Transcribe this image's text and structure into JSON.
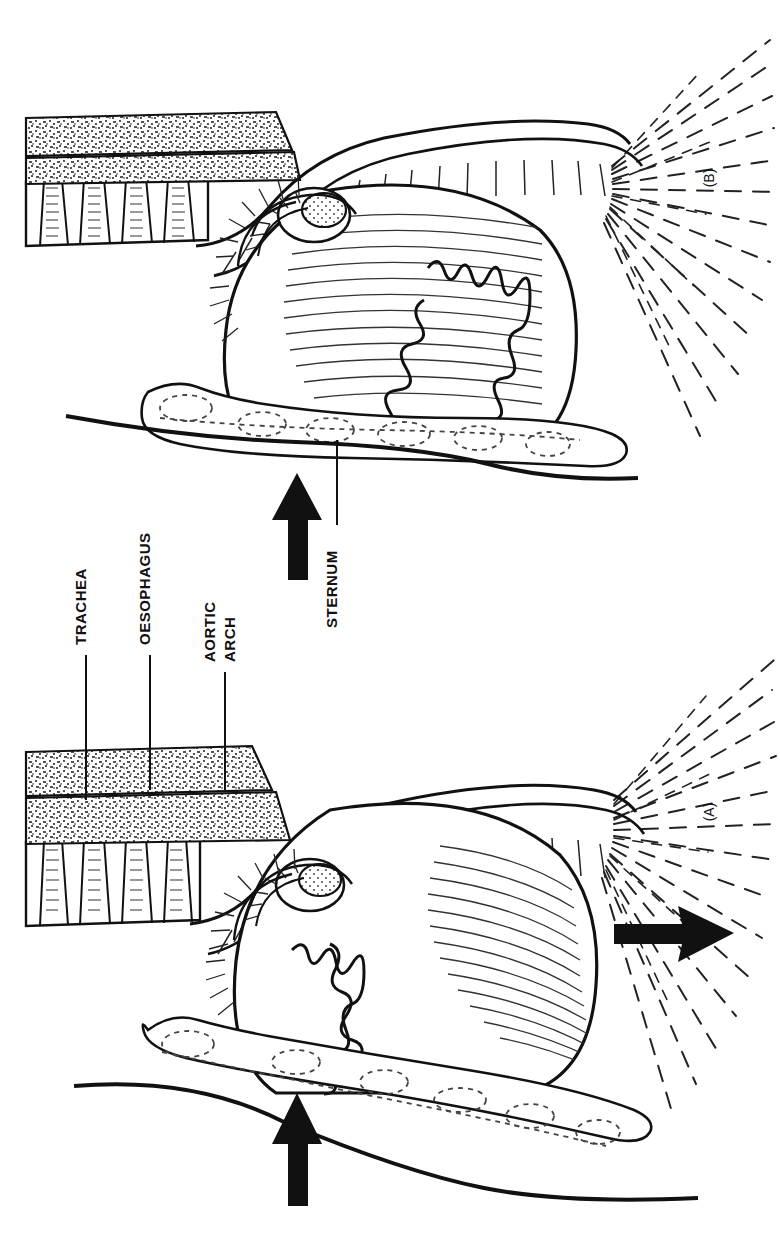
{
  "figure": {
    "type": "anatomical-line-illustration",
    "orientation": "rotated 90 degrees (text reads bottom-to-top)",
    "background_color": "#ffffff",
    "ink_color": "#111111",
    "width": 780,
    "height": 1239
  },
  "panels": [
    {
      "id": "B",
      "label": "(B)",
      "label_position": {
        "x": 714,
        "y": 178
      },
      "region": {
        "x": 0,
        "y": 0,
        "width": 780,
        "height": 620
      },
      "description": "Upper panel - thorax with upward arrow pressing on sternum, lung with jagged fissure margin"
    },
    {
      "id": "A",
      "label": "(A)",
      "label_position": {
        "x": 714,
        "y": 812
      },
      "region": {
        "x": 0,
        "y": 620,
        "width": 780,
        "height": 619
      },
      "description": "Lower panel - thorax with upward arrow on sternum and rightward arrow at the diaphragm/neck outflow"
    }
  ],
  "labels": [
    {
      "id": "trachea",
      "text": "TRACHEA",
      "text_x": 86,
      "text_y": 640,
      "leader": {
        "x1": 86,
        "y1": 655,
        "x2": 86,
        "y2": 800
      }
    },
    {
      "id": "oesophagus",
      "text": "OESOPHAGUS",
      "text_x": 150,
      "text_y": 640,
      "leader": {
        "x1": 150,
        "y1": 655,
        "x2": 150,
        "y2": 790
      }
    },
    {
      "id": "aortic-arch",
      "text": "AORTIC",
      "text2": "ARCH",
      "text_x": 221,
      "text_y": 640,
      "leader": {
        "x1": 225,
        "y1": 672,
        "x2": 225,
        "y2": 790
      }
    },
    {
      "id": "sternum",
      "text": "STERNUM",
      "text_x": 337,
      "text_y": 620,
      "leader": {
        "x1": 337,
        "y1": 525,
        "x2": 337,
        "y2": 440
      }
    }
  ],
  "arrows": [
    {
      "id": "arrow-sternum-b",
      "direction": "up",
      "panel": "B",
      "tip": {
        "x": 297,
        "y": 1093
      },
      "note": "solid black arrow pressing upward on the sternum, panel B"
    },
    {
      "id": "arrow-sternum-a",
      "direction": "up",
      "panel": "A",
      "tip": {
        "x": 492,
        "y": 466
      },
      "note": "solid black arrow pressing upward on the sternum, panel A"
    },
    {
      "id": "arrow-outflow-a",
      "direction": "right",
      "panel": "A",
      "tip": {
        "x": 728,
        "y": 933
      },
      "note": "solid black arrow pointing right through the radiating dashed lines"
    }
  ],
  "structures": [
    {
      "id": "vertebral-column",
      "name": "Vertebral column",
      "render": "hatched vertebral bodies"
    },
    {
      "id": "trachea-band",
      "name": "Trachea",
      "render": "stippled horizontal band"
    },
    {
      "id": "oesophagus-band",
      "name": "Oesophagus",
      "render": "stippled horizontal band"
    },
    {
      "id": "aortic-arch",
      "name": "Aortic arch",
      "render": "curved hatched tube"
    },
    {
      "id": "heart",
      "name": "Heart",
      "render": "large hatched mass"
    },
    {
      "id": "lung",
      "name": "Lung",
      "render": "hatched field with jagged fissure margin"
    },
    {
      "id": "sternum",
      "name": "Sternum",
      "render": "dotted-outline bony plate"
    },
    {
      "id": "body-wall",
      "name": "Body wall / skin outline",
      "render": "heavy contour line"
    },
    {
      "id": "radiating-lines",
      "name": "Radiating dashed lines",
      "render": "fan of dashed strokes"
    }
  ]
}
